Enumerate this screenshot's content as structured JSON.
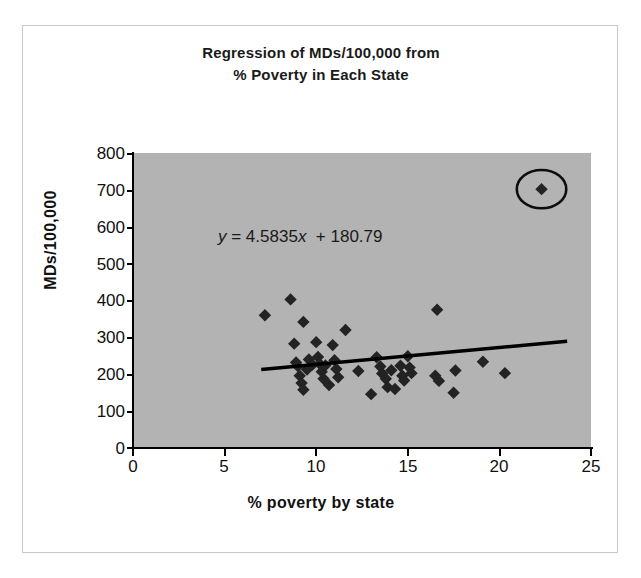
{
  "chart_data": {
    "type": "scatter",
    "title": "Regression of MDs/100,000 from % Poverty in Each State",
    "title_line1": "Regression of MDs/100,000 from",
    "title_line2": "% Poverty in Each State",
    "xlabel": "% poverty by state",
    "ylabel": "MDs/100,000",
    "xlim": [
      0,
      25
    ],
    "ylim": [
      0,
      800
    ],
    "xticks": [
      0,
      5,
      10,
      15,
      20,
      25
    ],
    "yticks": [
      0,
      100,
      200,
      300,
      400,
      500,
      600,
      700,
      800
    ],
    "grid": false,
    "legend": false,
    "plot_background": "#b3b3b3",
    "marker_color": "#232323",
    "marker_shape": "diamond",
    "annotations": [
      {
        "name": "regression-equation",
        "text": "y = 4.5835x  + 180.79",
        "slope": 4.5835,
        "intercept": 180.79
      }
    ],
    "trendline": {
      "type": "linear",
      "slope": 4.5835,
      "intercept": 180.79,
      "x_start": 7.0,
      "x_end": 23.7,
      "color": "#000000"
    },
    "highlight": {
      "shape": "ellipse",
      "label": "circled outlier",
      "x": 22.3,
      "y": 702,
      "rx_data": 1.35,
      "ry_data": 52
    },
    "points": [
      {
        "x": 7.2,
        "y": 360
      },
      {
        "x": 8.6,
        "y": 403
      },
      {
        "x": 8.8,
        "y": 283
      },
      {
        "x": 9.3,
        "y": 342
      },
      {
        "x": 8.9,
        "y": 232
      },
      {
        "x": 9.0,
        "y": 222
      },
      {
        "x": 9.1,
        "y": 196
      },
      {
        "x": 9.2,
        "y": 176
      },
      {
        "x": 9.3,
        "y": 158
      },
      {
        "x": 9.5,
        "y": 213
      },
      {
        "x": 9.6,
        "y": 240
      },
      {
        "x": 9.8,
        "y": 226
      },
      {
        "x": 10.0,
        "y": 287
      },
      {
        "x": 10.1,
        "y": 247
      },
      {
        "x": 10.2,
        "y": 228
      },
      {
        "x": 10.3,
        "y": 207
      },
      {
        "x": 10.4,
        "y": 188
      },
      {
        "x": 10.5,
        "y": 224
      },
      {
        "x": 10.7,
        "y": 171
      },
      {
        "x": 10.9,
        "y": 279
      },
      {
        "x": 11.0,
        "y": 238
      },
      {
        "x": 11.1,
        "y": 214
      },
      {
        "x": 11.2,
        "y": 192
      },
      {
        "x": 11.6,
        "y": 320
      },
      {
        "x": 12.3,
        "y": 209
      },
      {
        "x": 13.0,
        "y": 146
      },
      {
        "x": 13.3,
        "y": 246
      },
      {
        "x": 13.5,
        "y": 221
      },
      {
        "x": 13.6,
        "y": 202
      },
      {
        "x": 13.8,
        "y": 188
      },
      {
        "x": 13.9,
        "y": 165
      },
      {
        "x": 14.1,
        "y": 211
      },
      {
        "x": 14.3,
        "y": 160
      },
      {
        "x": 14.6,
        "y": 223
      },
      {
        "x": 14.7,
        "y": 196
      },
      {
        "x": 14.8,
        "y": 183
      },
      {
        "x": 15.0,
        "y": 249
      },
      {
        "x": 15.1,
        "y": 218
      },
      {
        "x": 15.2,
        "y": 203
      },
      {
        "x": 16.6,
        "y": 375
      },
      {
        "x": 16.5,
        "y": 196
      },
      {
        "x": 16.7,
        "y": 182
      },
      {
        "x": 17.6,
        "y": 210
      },
      {
        "x": 17.5,
        "y": 150
      },
      {
        "x": 19.1,
        "y": 234
      },
      {
        "x": 20.3,
        "y": 203
      },
      {
        "x": 22.3,
        "y": 702
      }
    ]
  }
}
